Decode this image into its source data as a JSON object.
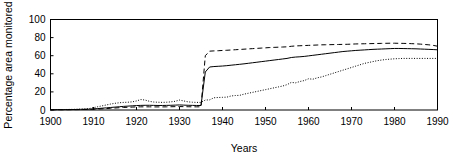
{
  "figure": {
    "background_color": "#ffffff",
    "line_color": "#000000"
  },
  "axes": {
    "y_title": "Percentage area monitored",
    "x_title": "Years",
    "y_ticks": [
      "0",
      "20",
      "40",
      "60",
      "80",
      "100"
    ],
    "x_ticks": [
      "1900",
      "1910",
      "1920",
      "1930",
      "1940",
      "1950",
      "1960",
      "1970",
      "1980",
      "1990"
    ]
  },
  "chart_data": {
    "type": "line",
    "title": "",
    "subtitle": "",
    "xlabel": "Years",
    "ylabel": "Percentage area monitored",
    "xlim": [
      1900,
      1990
    ],
    "ylim": [
      0,
      100
    ],
    "xticks": [
      1900,
      1910,
      1920,
      1930,
      1940,
      1950,
      1960,
      1970,
      1980,
      1990
    ],
    "yticks": [
      0,
      20,
      40,
      60,
      80,
      100
    ],
    "grid": false,
    "legend": "none",
    "x": [
      1900,
      1901,
      1902,
      1903,
      1904,
      1905,
      1906,
      1907,
      1908,
      1909,
      1910,
      1911,
      1912,
      1913,
      1914,
      1915,
      1916,
      1917,
      1918,
      1919,
      1920,
      1921,
      1922,
      1923,
      1924,
      1925,
      1926,
      1927,
      1928,
      1929,
      1930,
      1931,
      1932,
      1933,
      1934,
      1935,
      1936,
      1937,
      1938,
      1939,
      1940,
      1941,
      1942,
      1943,
      1944,
      1945,
      1946,
      1947,
      1948,
      1949,
      1950,
      1951,
      1952,
      1953,
      1954,
      1955,
      1956,
      1957,
      1958,
      1959,
      1960,
      1961,
      1962,
      1963,
      1964,
      1965,
      1966,
      1967,
      1968,
      1969,
      1970,
      1971,
      1972,
      1973,
      1974,
      1975,
      1976,
      1977,
      1978,
      1979,
      1980,
      1981,
      1982,
      1983,
      1984,
      1985,
      1986,
      1987,
      1988,
      1989,
      1990
    ],
    "series": [
      {
        "name": "solid-series",
        "style": "solid",
        "values": [
          0.3,
          0.3,
          0.4,
          0.4,
          0.5,
          0.5,
          0.6,
          0.7,
          0.8,
          0.9,
          1.2,
          1.6,
          2.0,
          2.4,
          2.8,
          3.2,
          3.6,
          4.0,
          4.3,
          4.6,
          4.9,
          5.1,
          5.2,
          5.2,
          5.1,
          5.0,
          5.0,
          5.1,
          5.2,
          5.4,
          5.6,
          5.4,
          5.2,
          5.1,
          5.0,
          5.0,
          42.0,
          47.5,
          48.0,
          48.3,
          48.6,
          49.0,
          49.5,
          50.0,
          50.5,
          51.0,
          51.6,
          52.2,
          52.8,
          53.4,
          54.0,
          54.6,
          55.2,
          55.8,
          56.4,
          57.0,
          58.0,
          58.5,
          58.8,
          59.2,
          59.8,
          60.4,
          61.0,
          61.6,
          62.2,
          62.8,
          63.4,
          64.0,
          64.6,
          65.0,
          65.4,
          65.8,
          66.1,
          66.4,
          66.7,
          67.0,
          67.2,
          67.4,
          67.6,
          67.8,
          68.0,
          68.0,
          67.9,
          67.8,
          67.7,
          67.6,
          67.4,
          67.2,
          67.0,
          66.8,
          66.5
        ]
      },
      {
        "name": "dashed-series",
        "style": "dashed",
        "values": [
          0.2,
          0.2,
          0.3,
          0.3,
          0.3,
          0.4,
          0.4,
          0.5,
          0.6,
          0.7,
          0.9,
          1.1,
          1.3,
          1.6,
          1.9,
          2.2,
          2.5,
          2.8,
          3.0,
          3.2,
          3.4,
          3.5,
          3.5,
          3.5,
          3.4,
          3.4,
          3.4,
          3.5,
          3.6,
          3.7,
          3.8,
          3.7,
          3.6,
          3.5,
          3.5,
          3.5,
          60.0,
          65.0,
          65.3,
          65.5,
          65.8,
          66.0,
          66.3,
          66.6,
          66.9,
          67.2,
          67.5,
          67.8,
          68.1,
          68.4,
          68.7,
          69.0,
          69.2,
          69.4,
          69.6,
          69.8,
          70.4,
          70.8,
          71.0,
          71.2,
          71.4,
          71.6,
          71.8,
          72.0,
          72.1,
          72.2,
          72.3,
          72.4,
          72.5,
          72.6,
          72.8,
          73.0,
          73.1,
          73.2,
          73.3,
          73.4,
          73.5,
          73.6,
          73.7,
          73.8,
          73.8,
          73.7,
          73.6,
          73.5,
          73.3,
          73.1,
          72.8,
          72.4,
          72.0,
          71.4,
          70.5
        ]
      },
      {
        "name": "dotted-series",
        "style": "dotted",
        "values": [
          0.4,
          0.4,
          0.5,
          0.5,
          0.6,
          0.7,
          0.8,
          1.0,
          1.2,
          1.6,
          2.6,
          3.6,
          4.6,
          5.6,
          6.6,
          7.4,
          8.0,
          8.4,
          8.6,
          9.0,
          10.0,
          11.6,
          11.0,
          9.6,
          8.8,
          8.6,
          8.4,
          8.6,
          9.0,
          9.6,
          11.0,
          10.0,
          9.0,
          8.6,
          8.4,
          8.4,
          11.0,
          11.2,
          13.5,
          13.8,
          14.0,
          14.2,
          15.5,
          16.0,
          16.2,
          17.5,
          18.5,
          19.5,
          20.5,
          21.5,
          22.5,
          23.5,
          24.5,
          25.5,
          26.5,
          28.0,
          30.5,
          30.0,
          31.5,
          32.5,
          34.5,
          34.0,
          35.5,
          36.5,
          38.0,
          39.5,
          41.0,
          42.5,
          44.0,
          45.5,
          47.0,
          48.5,
          50.0,
          51.5,
          52.5,
          53.5,
          54.5,
          55.2,
          55.8,
          56.2,
          56.6,
          56.8,
          57.0,
          57.0,
          57.0,
          57.0,
          57.0,
          57.0,
          57.0,
          57.0,
          57.0
        ]
      }
    ]
  }
}
